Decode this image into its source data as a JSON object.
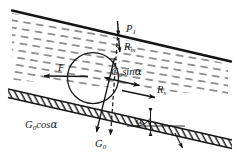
{
  "figure": {
    "type": "free-body-force-diagram",
    "colors": {
      "stroke": "#151515",
      "hatch": "#2b2b2b",
      "fluid_dash": "#4a4a4a",
      "background": "#ffffff"
    }
  },
  "labels": {
    "p1": {
      "symbol": "P",
      "subscript": "1",
      "text": "P₁"
    },
    "rm": {
      "symbol": "R",
      "subscript": "m",
      "text": "Rm"
    },
    "rs": {
      "symbol": "R",
      "subscript": "s",
      "text": "Rs"
    },
    "f": {
      "symbol": "F",
      "subscript": "",
      "text": "F"
    },
    "g0sina": {
      "symbol": "G",
      "subscript": "0",
      "suffix": "sin",
      "greek": "α",
      "text": "G0sinα"
    },
    "g0cosa": {
      "symbol": "G",
      "subscript": "0",
      "suffix": "cos",
      "greek": "α",
      "text": "G0cosα"
    },
    "g0": {
      "symbol": "G",
      "subscript": "0",
      "text": "G0"
    },
    "alpha": {
      "greek": "α",
      "text": "α"
    }
  },
  "elements": {
    "fluid_layer": "dashed-hatched inclined fluid band bounded above by a solid line",
    "slope_band": "cross-hatched inclined slope band",
    "particle": "circle representing the particle on the slope",
    "angle_marker": "angle alpha between slope surface and horizontal reference line"
  },
  "vectors": [
    {
      "name": "p1",
      "label": "P₁",
      "direction": "down",
      "style": "solid"
    },
    {
      "name": "rm",
      "label": "Rm",
      "direction": "down",
      "style": "solid"
    },
    {
      "name": "g0sina",
      "label": "G0sinα",
      "direction": "right-up-slope",
      "style": "solid"
    },
    {
      "name": "rs",
      "label": "Rs",
      "direction": "right-up-slope",
      "style": "solid"
    },
    {
      "name": "f",
      "label": "F",
      "direction": "left-down-slope",
      "style": "solid"
    },
    {
      "name": "g0cosa",
      "label": "G0cosα",
      "direction": "down-normal",
      "style": "solid"
    },
    {
      "name": "g0",
      "label": "G0",
      "direction": "down-vertical",
      "style": "dashed"
    }
  ]
}
